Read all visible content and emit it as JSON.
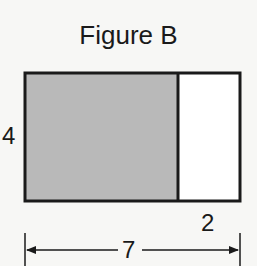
{
  "figure": {
    "title": "Figure B",
    "height_label": "4",
    "unshaded_width_label": "2",
    "total_width_label": "7",
    "colors": {
      "shaded": "#b9b9b9",
      "unshaded": "#ffffff",
      "stroke": "#1a1a1a"
    }
  }
}
